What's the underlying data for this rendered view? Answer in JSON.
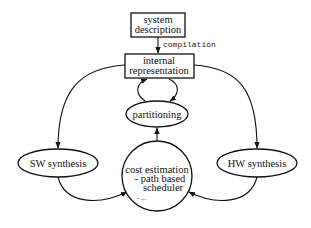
{
  "diagram": {
    "nodes": {
      "system_description": {
        "line1": "system",
        "line2": "description"
      },
      "internal_representation": {
        "line1": "internal",
        "line2": "representation"
      },
      "partitioning": {
        "label": "partitioning"
      },
      "sw_synthesis": {
        "label": "SW synthesis"
      },
      "hw_synthesis": {
        "label": "HW synthesis"
      },
      "cost_estimation": {
        "line1": "cost estimation",
        "line2": "- path based",
        "line3": "scheduler",
        "line4": "- ..."
      }
    },
    "edges": {
      "compilation": {
        "label": "compilation"
      }
    },
    "colors": {
      "stroke": "#111111",
      "background": "#ffffff"
    }
  }
}
